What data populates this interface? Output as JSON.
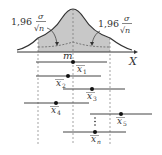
{
  "diagram": {
    "type": "confidence-intervals-normal-distribution",
    "curve_fill": "#c8c8c8",
    "line_color": "#444444",
    "axis_label": "X",
    "mean_label": "m",
    "left_annotation": {
      "coef": "1,96",
      "num": "σ",
      "den": "√n"
    },
    "right_annotation": {
      "coef": "1,96",
      "num": "σ",
      "den": "√n"
    },
    "intervals": [
      {
        "label": "x",
        "sub": "1",
        "dot": 73,
        "x1": 36,
        "x2": 107,
        "y": 62
      },
      {
        "label": "x",
        "sub": "2",
        "dot": 68,
        "x1": 36,
        "x2": 101,
        "y": 76
      },
      {
        "label": "x",
        "sub": "3",
        "dot": 92,
        "x1": 63,
        "x2": 125,
        "y": 89
      },
      {
        "label": "x",
        "sub": "4",
        "dot": 56,
        "x1": 24,
        "x2": 89,
        "y": 103
      },
      {
        "label": "x",
        "sub": "5",
        "dot": 121,
        "x1": 90,
        "x2": 152,
        "y": 114
      },
      {
        "label": "x",
        "sub": "n",
        "dot": 95,
        "x1": 63,
        "x2": 126,
        "y": 132
      }
    ]
  }
}
